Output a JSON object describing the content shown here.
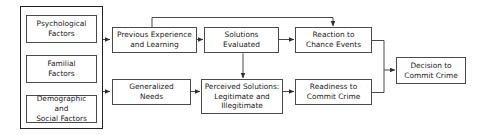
{
  "diagram": {
    "stroke_color": "#4a4a4a",
    "group_stroke_color": "#222222",
    "background": "#ffffff",
    "text_color": "#1a1a1a",
    "group": {
      "name": "factors-group",
      "items": [
        {
          "id": "psychological-factors",
          "label": "Psychological\nFactors"
        },
        {
          "id": "familial-factors",
          "label": "Familial\nFactors"
        },
        {
          "id": "demographic-social-factors",
          "label": "Demographic and\nSocial Factors"
        }
      ]
    },
    "nodes": [
      {
        "id": "previous-experience",
        "label": "Previous Experience\nand Learning"
      },
      {
        "id": "solutions-evaluated",
        "label": "Solutions\nEvaluated"
      },
      {
        "id": "reaction-chance-events",
        "label": "Reaction to\nChance Events"
      },
      {
        "id": "decision-commit-crime",
        "label": "Decision to\nCommit Crime"
      },
      {
        "id": "generalized-needs",
        "label": "Generalized\nNeeds"
      },
      {
        "id": "perceived-solutions",
        "label": "Perceived Solutions:\nLegitimate and\nIllegitimate"
      },
      {
        "id": "readiness-commit-crime",
        "label": "Readiness to\nCommit Crime"
      }
    ],
    "edges": [
      {
        "from": "factors-group",
        "to": "previous-experience"
      },
      {
        "from": "factors-group",
        "to": "generalized-needs"
      },
      {
        "from": "previous-experience",
        "to": "solutions-evaluated"
      },
      {
        "from": "solutions-evaluated",
        "to": "reaction-chance-events"
      },
      {
        "from": "solutions-evaluated",
        "to": "perceived-solutions"
      },
      {
        "from": "previous-experience",
        "to": "reaction-chance-events",
        "route": "top-feedback"
      },
      {
        "from": "generalized-needs",
        "to": "perceived-solutions"
      },
      {
        "from": "perceived-solutions",
        "to": "readiness-commit-crime"
      },
      {
        "from": "reaction-chance-events",
        "to": "decision-commit-crime"
      },
      {
        "from": "readiness-commit-crime",
        "to": "decision-commit-crime"
      }
    ]
  }
}
